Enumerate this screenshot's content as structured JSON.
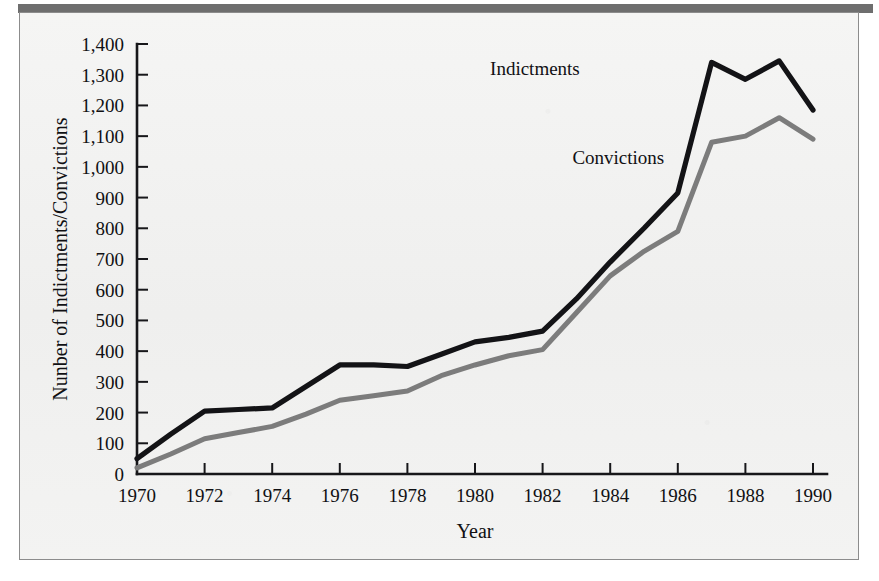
{
  "figure": {
    "background_color": "#f2f2f1",
    "frame_color": "#8c8c8c",
    "top_band_color": "#6e6e6e"
  },
  "chart_data": {
    "type": "line",
    "title": "",
    "xlabel": "Year",
    "ylabel": "Nunber of Indictments/Convictions",
    "xlim": [
      1970,
      1990
    ],
    "ylim": [
      0,
      1400
    ],
    "grid": false,
    "legend_position": "inline-annotations",
    "x": [
      1970,
      1971,
      1972,
      1973,
      1974,
      1975,
      1976,
      1977,
      1978,
      1979,
      1980,
      1981,
      1982,
      1983,
      1984,
      1985,
      1986,
      1987,
      1988,
      1989,
      1990
    ],
    "xticks": [
      1970,
      1972,
      1974,
      1976,
      1978,
      1980,
      1982,
      1984,
      1986,
      1988,
      1990
    ],
    "xtick_labels": [
      "1970",
      "1972",
      "1974",
      "1976",
      "1978",
      "1980",
      "1982",
      "1984",
      "1986",
      "1988",
      "1990"
    ],
    "yticks": [
      0,
      100,
      200,
      300,
      400,
      500,
      600,
      700,
      800,
      900,
      1000,
      1100,
      1200,
      1300,
      1400
    ],
    "ytick_labels": [
      "0",
      "100",
      "200",
      "300",
      "400",
      "500",
      "600",
      "700",
      "800",
      "900",
      "1,000",
      "1,100",
      "1,200",
      "1,300",
      "1,400"
    ],
    "series": [
      {
        "name": "Indictments",
        "color": "#131316",
        "label_position": {
          "x": 1983.1,
          "y": 1300
        },
        "values": [
          50,
          130,
          205,
          210,
          215,
          285,
          355,
          355,
          350,
          390,
          430,
          445,
          465,
          570,
          690,
          800,
          915,
          1340,
          1285,
          1345,
          1185
        ]
      },
      {
        "name": "Convictions",
        "color": "#7c7c7c",
        "label_position": {
          "x": 1985.6,
          "y": 1010
        },
        "values": [
          20,
          65,
          115,
          135,
          155,
          195,
          240,
          255,
          270,
          320,
          355,
          385,
          405,
          525,
          645,
          725,
          790,
          1080,
          1100,
          1160,
          1090
        ]
      }
    ]
  }
}
